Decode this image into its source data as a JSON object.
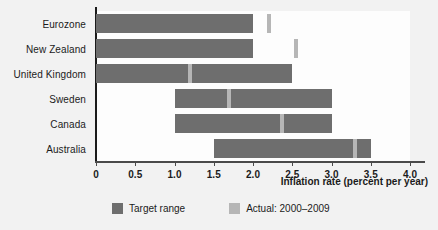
{
  "chart_data": {
    "type": "bar",
    "title": "",
    "xlabel": "Inflation rate (percent per year)",
    "ylabel": "",
    "xlim": [
      0,
      4.0
    ],
    "xticks": [
      "0",
      "0.5",
      "1.0",
      "1.5",
      "2.0",
      "2.5",
      "3.0",
      "3.5",
      "4.0"
    ],
    "xtick_values": [
      0,
      0.5,
      1.0,
      1.5,
      2.0,
      2.5,
      3.0,
      3.5,
      4.0
    ],
    "grid": false,
    "orientation": "horizontal",
    "legend_position": "bottom",
    "categories": [
      "Eurozone",
      "New Zealand",
      "United Kingdom",
      "Sweden",
      "Canada",
      "Australia"
    ],
    "series": [
      {
        "name": "Target range",
        "type": "range",
        "color": "#6e6e6e",
        "values": [
          {
            "category": "Eurozone",
            "low": 0.0,
            "high": 2.0
          },
          {
            "category": "New Zealand",
            "low": 0.0,
            "high": 2.0
          },
          {
            "category": "United Kingdom",
            "low": 0.0,
            "high": 2.5
          },
          {
            "category": "Sweden",
            "low": 1.0,
            "high": 3.0
          },
          {
            "category": "Canada",
            "low": 1.0,
            "high": 3.0
          },
          {
            "category": "Australia",
            "low": 1.5,
            "high": 3.5
          }
        ]
      },
      {
        "name": "Actual: 2000–2009",
        "type": "marker",
        "color": "#b6b6b6",
        "values": [
          {
            "category": "Eurozone",
            "value": 2.2
          },
          {
            "category": "New Zealand",
            "value": 2.55
          },
          {
            "category": "United Kingdom",
            "value": 1.2
          },
          {
            "category": "Sweden",
            "value": 1.7
          },
          {
            "category": "Canada",
            "value": 2.37
          },
          {
            "category": "Australia",
            "value": 3.3
          }
        ]
      }
    ]
  },
  "legend": {
    "items": [
      {
        "label": "Target range",
        "swatch": "target"
      },
      {
        "label": "Actual: 2000–2009",
        "swatch": "actual"
      }
    ]
  },
  "colors": {
    "target": "#6e6e6e",
    "actual": "#b6b6b6",
    "background": "#f2f2f2",
    "plot_background": "#fdfdfd",
    "axis": "#1b1b1b",
    "text": "#1b1b1b"
  }
}
